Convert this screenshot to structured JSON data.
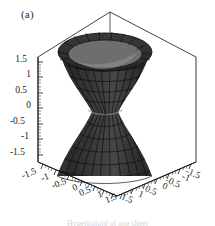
{
  "figure": {
    "panel_label": "(a)",
    "caption": "Hyperboloid of one sheet",
    "background_color": "#ffffff"
  },
  "colors": {
    "axis_line": "#1a1a1a",
    "box_line": "#111111",
    "tick_label": "#1c1c1c",
    "surface_dark": "#3a3a3a",
    "surface_darker": "#2b2b2b",
    "surface_mid": "#4d4d4d",
    "surface_light": "#6f6f6f",
    "surface_lighter": "#8a8a8a",
    "mesh_line": "#111111",
    "rim_highlight": "#9a9a9a"
  },
  "chart_data": {
    "type": "surface3d",
    "title": "(a)",
    "surface_name": "hyperboloid-of-one-sheet",
    "equation": "x^2 + y^2 - z^2 = 1",
    "parametric": {
      "x": "sqrt(1 + v^2) * cos(u)",
      "y": "sqrt(1 + v^2) * sin(u)",
      "z": "v"
    },
    "u_range": [
      0,
      6.283185307179586
    ],
    "v_range": [
      -1.5,
      1.5
    ],
    "xlabel": "",
    "ylabel": "",
    "zlabel": "",
    "xlim": [
      -1.5,
      1.5
    ],
    "ylim": [
      -1.5,
      1.5
    ],
    "zlim": [
      -1.5,
      1.5
    ],
    "grid": false,
    "box": true,
    "mesh": true,
    "mesh_u_divisions": 24,
    "mesh_v_divisions": 14,
    "legend": null,
    "shading": "grayscale",
    "waist_radius": 1.0,
    "top_radius": 1.803,
    "bottom_radius": 1.803,
    "z_axis": {
      "name": "z-axis",
      "position": "left-vertical",
      "ticks": [
        1.5,
        1,
        0.5,
        0,
        -0.5,
        -1,
        -1.5
      ],
      "tick_labels": [
        "1.5",
        "1",
        "0.5",
        "0",
        "-0.5",
        "-1",
        "-1.5"
      ]
    },
    "x_axis": {
      "name": "x-axis",
      "position": "bottom-front-left",
      "ticks": [
        -1.5,
        -1,
        -0.5,
        0,
        0.5,
        1,
        1.5
      ],
      "tick_labels": [
        "-1.5",
        "-1",
        "-0.5",
        "0",
        "0.5",
        "1",
        "1.5"
      ]
    },
    "y_axis": {
      "name": "y-axis",
      "position": "bottom-front-right",
      "ticks": [
        1.5,
        1,
        0.5,
        0,
        -0.5,
        -1,
        -1.5
      ],
      "tick_labels": [
        "1.5",
        "1",
        "0.5",
        "0",
        "-0.5",
        "-1",
        "-1.5"
      ]
    }
  },
  "axes": {
    "z_ticks": [
      {
        "label": "1.5",
        "x": 27,
        "y": 62
      },
      {
        "label": "1",
        "x": 31,
        "y": 77
      },
      {
        "label": "0.5",
        "x": 27,
        "y": 93
      },
      {
        "label": "0",
        "x": 31,
        "y": 108
      },
      {
        "label": "-0.5",
        "x": 25,
        "y": 124
      },
      {
        "label": "-1",
        "x": 29,
        "y": 139
      },
      {
        "label": "-1.5",
        "x": 25,
        "y": 155
      }
    ],
    "x_ticks": [
      {
        "label": "-1.5",
        "x": 30,
        "y": 176,
        "rot": -22
      },
      {
        "label": "-1",
        "x": 46,
        "y": 180,
        "rot": -22
      },
      {
        "label": "-0.5",
        "x": 60,
        "y": 186,
        "rot": -22
      },
      {
        "label": "0",
        "x": 76,
        "y": 190,
        "rot": -22
      },
      {
        "label": "0.5",
        "x": 86,
        "y": 194,
        "rot": -22
      },
      {
        "label": "1",
        "x": 101,
        "y": 197,
        "rot": -22
      },
      {
        "label": "1.5",
        "x": 112,
        "y": 201,
        "rot": -22
      }
    ],
    "y_ticks": [
      {
        "label": "1.5",
        "x": 126,
        "y": 201,
        "rot": 22
      },
      {
        "label": "1",
        "x": 140,
        "y": 197,
        "rot": 22
      },
      {
        "label": "0.5",
        "x": 150,
        "y": 193,
        "rot": 22
      },
      {
        "label": "0",
        "x": 164,
        "y": 189,
        "rot": 22
      },
      {
        "label": "-0.5",
        "x": 172,
        "y": 185,
        "rot": 22
      },
      {
        "label": "-1",
        "x": 185,
        "y": 180,
        "rot": 22
      },
      {
        "label": "-1.5",
        "x": 192,
        "y": 176,
        "rot": 22
      }
    ]
  }
}
